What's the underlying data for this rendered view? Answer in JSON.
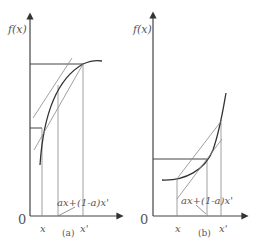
{
  "panels": [
    {
      "id": "a",
      "caption": "(a)",
      "y_axis_label": "f(x)",
      "origin_label": "0",
      "x_label": "x",
      "x_prime_label": "x'",
      "combo_label": "ax+(1-a)x'",
      "curve": "concave"
    },
    {
      "id": "b",
      "caption": "(b)",
      "y_axis_label": "f(x)",
      "origin_label": "0",
      "x_label": "x",
      "x_prime_label": "x'",
      "combo_label": "ax+(1-a)x'",
      "curve": "convex"
    }
  ],
  "colors": {
    "line": "#444444",
    "thin": "#888888",
    "text": "#555555"
  }
}
